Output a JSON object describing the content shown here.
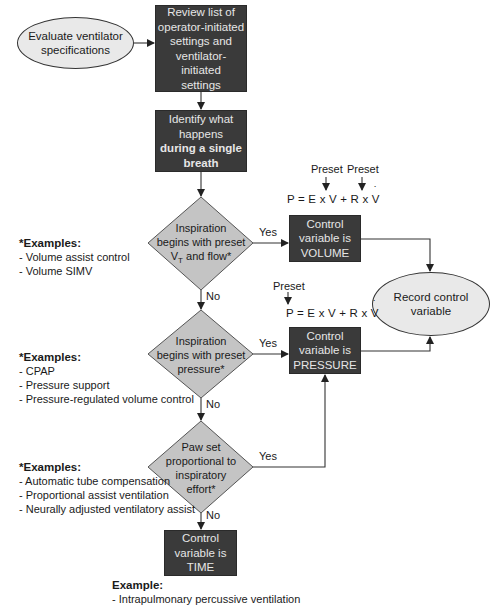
{
  "start": {
    "label_line1": "Evaluate ventilator",
    "label_line2": "specifications"
  },
  "review_box": {
    "lines": [
      "Review list of",
      "operator-initiated",
      "settings and",
      "ventilator-initiated",
      "settings"
    ]
  },
  "identify_box": {
    "line1": "Identify what",
    "line2": "happens",
    "line3_bold": "during a single",
    "line4_bold": "breath"
  },
  "decision1": {
    "line1": "Inspiration",
    "line2": "begins with preset",
    "line3_prefix": "V",
    "line3_sub": "T",
    "line3_suffix": " and flow*",
    "yes_label": "Yes",
    "no_label": "No"
  },
  "decision2": {
    "line1": "Inspiration",
    "line2": "begins with preset",
    "line3": "pressure*",
    "yes_label": "Yes",
    "no_label": "No"
  },
  "decision3": {
    "line1": "Paw set",
    "line2": "proportional to",
    "line3": "inspiratory",
    "line4": "effort*",
    "yes_label": "Yes",
    "no_label": "No"
  },
  "volume_box": {
    "line1": "Control",
    "line2": "variable is",
    "line3": "VOLUME"
  },
  "pressure_box": {
    "line1": "Control",
    "line2": "variable is",
    "line3": "PRESSURE"
  },
  "time_box": {
    "line1": "Control",
    "line2": "variable is",
    "line3": "TIME"
  },
  "record_oval": {
    "line1": "Record control",
    "line2": "variable"
  },
  "equation_volume": {
    "preset1": "Preset",
    "preset2": "Preset",
    "lhs": "P = E x ",
    "v1": "V",
    "mid": " + R x ",
    "v2": "V"
  },
  "equation_pressure": {
    "preset": "Preset",
    "lhs": "P = E x ",
    "v1": "V",
    "mid": " + R x ",
    "v2": "V"
  },
  "examples_volume": {
    "title": "*Examples:",
    "items": [
      "- Volume assist control",
      "- Volume SIMV"
    ]
  },
  "examples_pressure": {
    "title": "*Examples:",
    "items": [
      "- CPAP",
      "- Pressure support",
      "- Pressure-regulated volume control"
    ]
  },
  "examples_proportional": {
    "title": "*Examples:",
    "items": [
      "- Automatic tube compensation",
      "- Proportional assist ventilation",
      "- Neurally adjusted ventilatory assist"
    ]
  },
  "examples_time": {
    "title": "Example:",
    "items": [
      "- Intrapulmonary percussive ventilation"
    ]
  },
  "colors": {
    "dark_box": "#3a3a3a",
    "diamond_fill": "#c4c4c4",
    "oval_fill": "#e9e9e9",
    "line": "#333333"
  }
}
